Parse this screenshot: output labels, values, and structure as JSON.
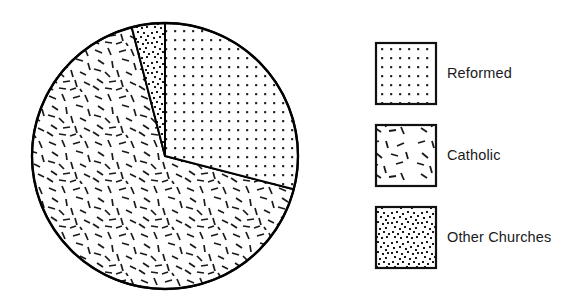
{
  "chart_data": {
    "type": "pie",
    "title": "",
    "subtitle": "",
    "xlabel": "",
    "ylabel": "",
    "grid": false,
    "legend_position": "right",
    "categories": [
      "Reformed",
      "Catholic",
      "Other Churches"
    ],
    "values": [
      29,
      67,
      4
    ],
    "unit": "percent",
    "start_angle_deg": 0,
    "direction": "clockwise",
    "slices": [
      {
        "label": "Reformed",
        "value": 29,
        "start_angle_deg": 0,
        "end_angle_deg": 104.5,
        "fill_pattern": "regular-dot-grid",
        "fill_color": "#ffffff",
        "stroke_color": "#000000"
      },
      {
        "label": "Catholic",
        "value": 67,
        "start_angle_deg": 104.5,
        "end_angle_deg": 345.5,
        "fill_pattern": "scattered-dashes",
        "fill_color": "#ffffff",
        "stroke_color": "#000000"
      },
      {
        "label": "Other Churches",
        "value": 4,
        "start_angle_deg": 345.5,
        "end_angle_deg": 360,
        "fill_pattern": "dense-random-dots",
        "fill_color": "#ffffff",
        "stroke_color": "#000000"
      }
    ]
  },
  "chart": {
    "center_x": 165,
    "center_y": 156,
    "radius": 133,
    "outline_color": "#000000",
    "background_color": "#ffffff"
  },
  "legend": {
    "items": [
      {
        "label": "Reformed",
        "pattern": "regular-dot-grid"
      },
      {
        "label": "Catholic",
        "pattern": "scattered-dashes"
      },
      {
        "label": "Other Churches",
        "pattern": "dense-random-dots"
      }
    ]
  }
}
